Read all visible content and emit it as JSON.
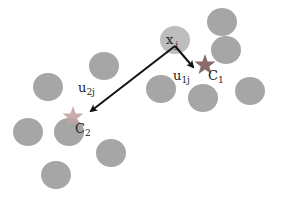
{
  "diagram": {
    "type": "clustering-distance",
    "colors": {
      "point": "#a6a6a6",
      "point_highlight": "#bdbdbd",
      "centroid1": "#8a6a6a",
      "centroid2": "#c4a3a3",
      "arrow": "#111111",
      "background": "#ffffff"
    },
    "points": [
      {
        "id": "xj",
        "cx": 175,
        "cy": 40,
        "r": 14,
        "highlight": true
      },
      {
        "cx": 222,
        "cy": 22,
        "r": 14
      },
      {
        "cx": 226,
        "cy": 50,
        "r": 14
      },
      {
        "cx": 161,
        "cy": 89,
        "r": 14
      },
      {
        "cx": 203,
        "cy": 98,
        "r": 14
      },
      {
        "cx": 250,
        "cy": 91,
        "r": 14
      },
      {
        "cx": 104,
        "cy": 66,
        "r": 14
      },
      {
        "cx": 48,
        "cy": 87,
        "r": 14
      },
      {
        "cx": 28,
        "cy": 132,
        "r": 14
      },
      {
        "cx": 69,
        "cy": 132,
        "r": 14
      },
      {
        "cx": 111,
        "cy": 153,
        "r": 14
      },
      {
        "cx": 56,
        "cy": 175,
        "r": 14
      }
    ],
    "centroids": [
      {
        "id": "c1",
        "cx": 205,
        "cy": 65,
        "label_main": "C",
        "label_sub": "1"
      },
      {
        "id": "c2",
        "cx": 73,
        "cy": 117,
        "label_main": "C",
        "label_sub": "2"
      }
    ],
    "labels": {
      "xj": {
        "main": "x",
        "sub": "j"
      },
      "u1j": {
        "main": "u",
        "sub": "1j"
      },
      "u2j": {
        "main": "u",
        "sub": "2j"
      }
    },
    "arrows": [
      {
        "from": [
          175,
          46
        ],
        "to": [
          193,
          67
        ]
      },
      {
        "from": [
          175,
          46
        ],
        "to": [
          91,
          111
        ]
      }
    ]
  }
}
